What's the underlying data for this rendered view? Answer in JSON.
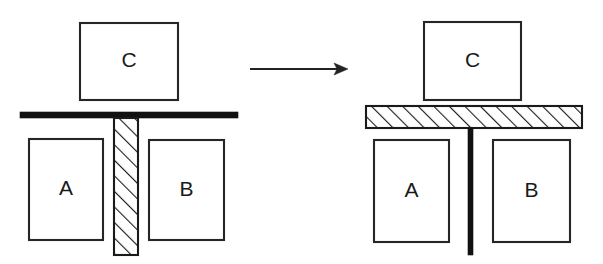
{
  "figure": {
    "background_color": "#ffffff",
    "line_color": "#262626",
    "solid_fill_color": "#111111",
    "hatch_fill_color": "#ffffff",
    "canvas": {
      "width": 603,
      "height": 264
    }
  },
  "panels": [
    {
      "id": "left-panel",
      "name": "before-state",
      "blocks": [
        {
          "id": "left-block-c",
          "label": "C",
          "x": 80,
          "y": 23,
          "width": 98,
          "height": 77
        },
        {
          "id": "left-block-a",
          "label": "A",
          "x": 29,
          "y": 139,
          "width": 74,
          "height": 101
        },
        {
          "id": "left-block-b",
          "label": "B",
          "x": 149,
          "y": 140,
          "width": 75,
          "height": 100
        }
      ],
      "beam": {
        "id": "left-beam",
        "style": "solid-black",
        "orientation": "horizontal",
        "x": 20,
        "y": 112,
        "width": 218,
        "height": 6
      },
      "post": {
        "id": "left-post",
        "style": "hatched",
        "orientation": "vertical",
        "x": 114,
        "y": 118,
        "width": 24,
        "height": 137
      }
    },
    {
      "id": "right-panel",
      "name": "after-state",
      "blocks": [
        {
          "id": "right-block-c",
          "label": "C",
          "x": 424,
          "y": 22,
          "width": 97,
          "height": 78
        },
        {
          "id": "right-block-a",
          "label": "A",
          "x": 374,
          "y": 140,
          "width": 75,
          "height": 102
        },
        {
          "id": "right-block-b",
          "label": "B",
          "x": 493,
          "y": 140,
          "width": 77,
          "height": 102
        }
      ],
      "beam": {
        "id": "right-beam",
        "style": "hatched",
        "orientation": "horizontal",
        "x": 366,
        "y": 106,
        "width": 216,
        "height": 22
      },
      "post": {
        "id": "right-post",
        "style": "solid-black",
        "orientation": "vertical",
        "x": 468,
        "y": 128,
        "width": 5,
        "height": 127
      }
    }
  ],
  "arrow": {
    "id": "transition-arrow",
    "direction": "right",
    "x1": 250,
    "y1": 69,
    "x2": 348,
    "y2": 69,
    "color": "#232323"
  }
}
